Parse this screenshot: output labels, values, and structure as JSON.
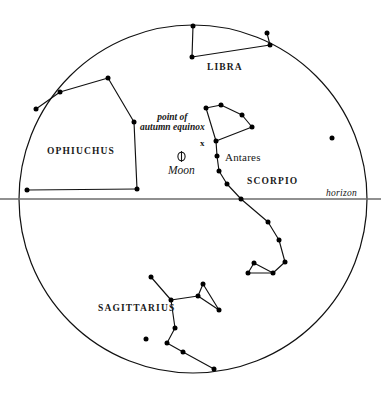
{
  "figure": {
    "type": "sky-chart",
    "width": 381,
    "height": 395,
    "background_color": "#ffffff",
    "line_color": "#111111",
    "star_color": "#000000"
  },
  "horizon": {
    "label": "horizon",
    "label_x": 326,
    "label_y": 188,
    "y": 199,
    "x_start": 0,
    "x_end": 381,
    "color": "#6b6b6b"
  },
  "celestial_circle": {
    "center_x": 193,
    "center_y": 199,
    "radius": 174,
    "stroke": "#111111"
  },
  "constellation_labels": [
    {
      "name": "libra-label",
      "text": "LIBRA",
      "x": 207,
      "y": 62
    },
    {
      "name": "ophiuchus-label",
      "text": "OPHIUCHUS",
      "x": 47,
      "y": 146
    },
    {
      "name": "scorpio-label",
      "text": "SCORPIO",
      "x": 247,
      "y": 176
    },
    {
      "name": "sagittarius-label",
      "text": "SAGITTARIUS",
      "x": 98,
      "y": 303
    }
  ],
  "star_labels": [
    {
      "name": "antares-label",
      "text": "Antares",
      "x": 225,
      "y": 152
    }
  ],
  "annotations": {
    "equinox": {
      "line1": "point of",
      "line2": "autumn equinox",
      "text_x": 140,
      "text_y": 112,
      "marker": "x",
      "marker_x": 200,
      "marker_y": 139
    },
    "moon": {
      "label": "Moon",
      "symbol": "moon-symbol",
      "symbol_x": 175,
      "symbol_y": 150,
      "label_x": 168,
      "label_y": 164
    }
  },
  "chart_data": {
    "type": "scatter",
    "title": "",
    "constellations": [
      {
        "name": "LIBRA",
        "stars": [
          {
            "x": 193,
            "y": 26
          },
          {
            "x": 192,
            "y": 57
          },
          {
            "x": 270,
            "y": 45
          },
          {
            "x": 267,
            "y": 33
          }
        ],
        "lines": [
          [
            0,
            1
          ],
          [
            1,
            2
          ],
          [
            2,
            3
          ]
        ]
      },
      {
        "name": "OPHIUCHUS",
        "stars": [
          {
            "x": 108,
            "y": 78
          },
          {
            "x": 60,
            "y": 92
          },
          {
            "x": 36,
            "y": 109
          },
          {
            "x": 27,
            "y": 190
          },
          {
            "x": 137,
            "y": 189
          },
          {
            "x": 134,
            "y": 122
          }
        ],
        "lines": [
          [
            0,
            1
          ],
          [
            1,
            2
          ],
          [
            3,
            4
          ],
          [
            4,
            5
          ],
          [
            5,
            0
          ]
        ]
      },
      {
        "name": "SCORPIO",
        "stars": [
          {
            "x": 206,
            "y": 108
          },
          {
            "x": 221,
            "y": 105
          },
          {
            "x": 242,
            "y": 115
          },
          {
            "x": 252,
            "y": 127
          },
          {
            "x": 216,
            "y": 141
          },
          {
            "x": 217,
            "y": 156
          },
          {
            "x": 219,
            "y": 171
          },
          {
            "x": 227,
            "y": 184
          },
          {
            "x": 241,
            "y": 199
          },
          {
            "x": 268,
            "y": 222
          },
          {
            "x": 279,
            "y": 240
          },
          {
            "x": 285,
            "y": 262
          },
          {
            "x": 273,
            "y": 273
          },
          {
            "x": 248,
            "y": 273
          },
          {
            "x": 254,
            "y": 263
          }
        ],
        "lines": [
          [
            0,
            1
          ],
          [
            1,
            2
          ],
          [
            2,
            3
          ],
          [
            3,
            4
          ],
          [
            4,
            0
          ],
          [
            4,
            5
          ],
          [
            5,
            6
          ],
          [
            6,
            7
          ],
          [
            7,
            8
          ],
          [
            8,
            9
          ],
          [
            9,
            10
          ],
          [
            10,
            11
          ],
          [
            11,
            12
          ],
          [
            12,
            13
          ],
          [
            13,
            14
          ],
          [
            14,
            12
          ]
        ]
      },
      {
        "name": "SAGITTARIUS",
        "stars": [
          {
            "x": 151,
            "y": 277
          },
          {
            "x": 171,
            "y": 300
          },
          {
            "x": 198,
            "y": 296
          },
          {
            "x": 203,
            "y": 284
          },
          {
            "x": 219,
            "y": 310
          },
          {
            "x": 175,
            "y": 328
          },
          {
            "x": 167,
            "y": 343
          },
          {
            "x": 183,
            "y": 352
          },
          {
            "x": 214,
            "y": 369
          }
        ],
        "lines": [
          [
            0,
            1
          ],
          [
            1,
            2
          ],
          [
            2,
            3
          ],
          [
            3,
            4
          ],
          [
            4,
            2
          ],
          [
            1,
            5
          ],
          [
            5,
            6
          ],
          [
            6,
            7
          ],
          [
            7,
            8
          ]
        ]
      }
    ],
    "isolated_stars": [
      {
        "name": "field-star-right",
        "x": 332,
        "y": 138
      },
      {
        "name": "field-star-sagittarius",
        "x": 146,
        "y": 339
      }
    ]
  }
}
